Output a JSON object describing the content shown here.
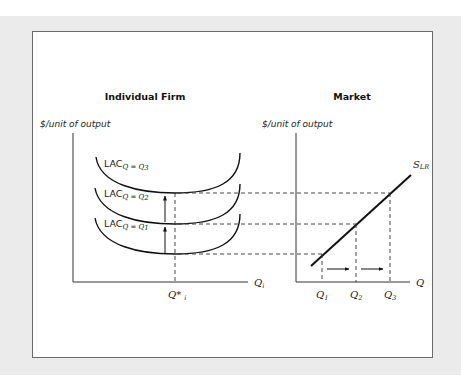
{
  "figure": {
    "left_panel": {
      "title": "Individual Firm",
      "y_axis_label": "$/unit of output",
      "x_axis_label": "Q",
      "x_axis_sub": "i",
      "equilibrium_label": "Q*",
      "equilibrium_sub": "i",
      "curves": [
        {
          "label": "LAC",
          "subscript": "Q = Q",
          "subscript_index": "3"
        },
        {
          "label": "LAC",
          "subscript": "Q = Q",
          "subscript_index": "2"
        },
        {
          "label": "LAC",
          "subscript": "Q = Q",
          "subscript_index": "1"
        }
      ],
      "arrows": [
        {
          "direction": "up",
          "from": "LAC Q=Q1",
          "to": "LAC Q=Q2"
        },
        {
          "direction": "up",
          "from": "LAC Q=Q2",
          "to": "LAC Q=Q3"
        }
      ]
    },
    "right_panel": {
      "title": "Market",
      "y_axis_label": "$/unit of output",
      "x_axis_label": "Q",
      "supply_label": "S",
      "supply_sub": "LR",
      "ticks": [
        {
          "label": "Q",
          "sub": "1"
        },
        {
          "label": "Q",
          "sub": "2"
        },
        {
          "label": "Q",
          "sub": "3"
        }
      ],
      "arrows": [
        {
          "direction": "right",
          "from": "Q1",
          "to": "Q2"
        },
        {
          "direction": "right",
          "from": "Q2",
          "to": "Q3"
        }
      ]
    },
    "colors": {
      "background": "#ebebeb",
      "panel": "#ffffff",
      "border": "#6a6a6a",
      "ink": "#111111"
    }
  }
}
